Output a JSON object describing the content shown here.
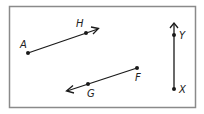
{
  "diagram": {
    "frame": {
      "x": 9,
      "y": 6,
      "width": 186,
      "height": 102,
      "stroke": "#8a8a8a"
    },
    "figures": [
      {
        "type": "ray",
        "name": "ray-AH",
        "from": "A",
        "through": "H",
        "points": {
          "A": [
            28,
            53
          ],
          "H": [
            86,
            33
          ]
        },
        "arrow_end": [
          99,
          28
        ]
      },
      {
        "type": "ray",
        "name": "ray-FG",
        "from": "F",
        "through": "G",
        "points": {
          "F": [
            137,
            68
          ],
          "G": [
            88,
            84
          ]
        },
        "arrow_end": [
          66,
          91
        ]
      },
      {
        "type": "ray",
        "name": "ray-XY",
        "from": "X",
        "through": "Y",
        "points": {
          "X": [
            174,
            89
          ],
          "Y": [
            174,
            35
          ]
        },
        "arrow_end": [
          174,
          23
        ]
      }
    ],
    "labels": {
      "A": "A",
      "H": "H",
      "F": "F",
      "G": "G",
      "X": "X",
      "Y": "Y"
    },
    "colors": {
      "line": "#1a1a1a",
      "frame": "#8a8a8a"
    }
  }
}
